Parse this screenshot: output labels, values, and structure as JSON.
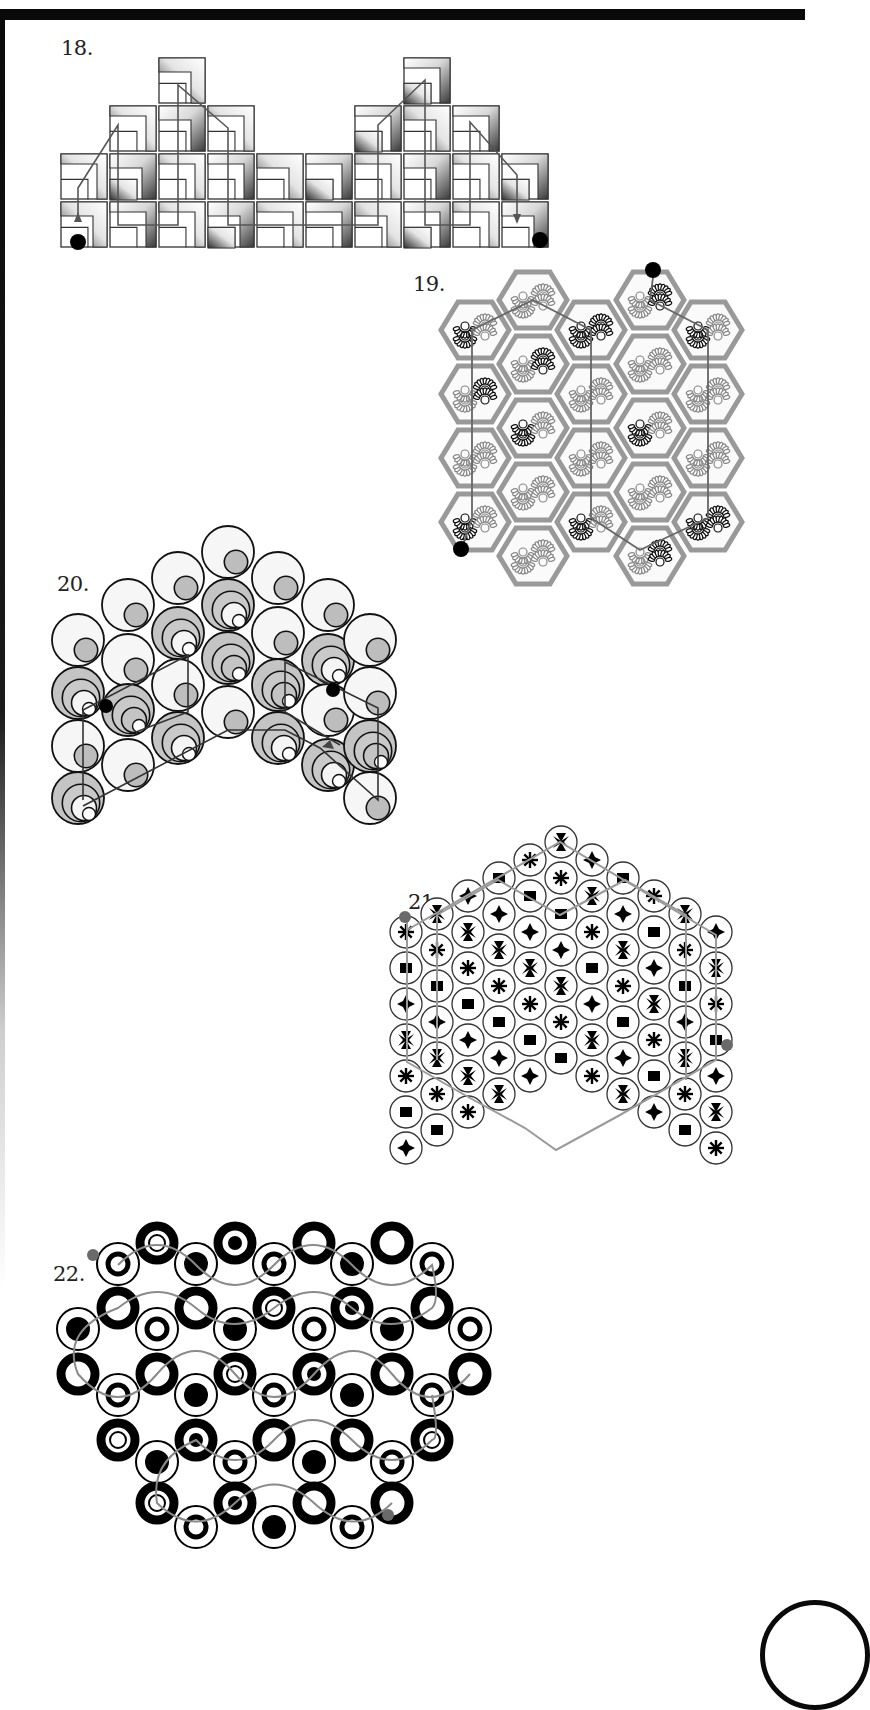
{
  "page": {
    "frame_color": "#0a0a0a",
    "path_color_dark": "#555555",
    "path_color_light": "#8a8a8a",
    "marker_color_dark": "#000000",
    "marker_color_grey": "#6a6a6a"
  },
  "puzzles": [
    {
      "number": "18.",
      "type": "square-tile-maze",
      "rows_from_top": [
        {
          "row": 0,
          "columns": [
            2,
            7
          ]
        },
        {
          "row": 1,
          "columns": [
            1,
            2,
            3,
            6,
            7,
            8
          ]
        },
        {
          "row": 2,
          "columns": [
            0,
            1,
            2,
            3,
            4,
            5,
            6,
            7,
            8,
            9
          ]
        },
        {
          "row": 3,
          "columns": [
            0,
            1,
            2,
            3,
            4,
            5,
            6,
            7,
            8,
            9
          ]
        }
      ],
      "start_marker": "black-dot-bottom-left",
      "end_marker": "black-dot-bottom-right"
    },
    {
      "number": "19.",
      "type": "hexagon-tile-maze",
      "columns": 5,
      "rows": 4,
      "tile_motif": "paired-spiral-rosettes",
      "start_marker": "black-dot-top-right",
      "end_marker": "black-dot-bottom-left"
    },
    {
      "number": "20.",
      "type": "nested-circle-maze",
      "columns": 7,
      "rows": 5,
      "start_marker": "black-dot-left",
      "end_marker": "black-dot-right"
    },
    {
      "number": "21.",
      "type": "hexagonal-circle-grid-maze",
      "side_length": 6,
      "tile_symbols": [
        "cross",
        "star",
        "square",
        "burst"
      ],
      "start_marker": "grey-dot-left",
      "end_marker": "grey-dot-right"
    },
    {
      "number": "22.",
      "type": "ring-circle-maze",
      "rows": 7,
      "tile_types": [
        "thick-ring",
        "ring-with-dot",
        "solid-disc-in-ring",
        "double-ring"
      ],
      "start_marker": "grey-dot-top-left",
      "end_marker": "grey-dot-bottom-right"
    }
  ]
}
